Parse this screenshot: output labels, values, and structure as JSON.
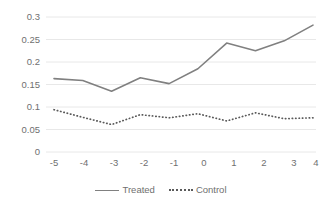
{
  "chart_data": {
    "type": "line",
    "title": "",
    "subtitle": "",
    "xlabel": "",
    "ylabel": "",
    "x": [
      -5,
      -4,
      -3,
      -2,
      -1,
      0,
      1,
      2,
      3,
      4
    ],
    "xtick_labels": [
      "-5",
      "-4",
      "-3",
      "-2",
      "-1",
      "0",
      "1",
      "2",
      "3",
      "4"
    ],
    "ytick_labels": [
      "0.3",
      "0.25",
      "0.2",
      "0.15",
      "0.1",
      "0.05",
      "0"
    ],
    "ytick_values": [
      0.3,
      0.25,
      0.2,
      0.15,
      0.1,
      0.05,
      0
    ],
    "ylim": [
      0,
      0.3
    ],
    "xlim": [
      -5,
      4
    ],
    "grid": "horizontal",
    "legend_position": "bottom-center",
    "series": [
      {
        "name": "Treated",
        "style": "solid",
        "color": "#808080",
        "values": [
          0.163,
          0.159,
          0.135,
          0.165,
          0.152,
          0.185,
          0.242,
          0.225,
          0.247,
          0.282
        ]
      },
      {
        "name": "Control",
        "style": "dotted",
        "color": "#5a5a5a",
        "values": [
          0.094,
          0.077,
          0.061,
          0.083,
          0.076,
          0.085,
          0.069,
          0.087,
          0.074,
          0.076
        ]
      }
    ],
    "colors": {
      "treated": "#808080",
      "control": "#5a5a5a",
      "gridline": "#e8e8e8",
      "tick_text": "#6f6f6f",
      "background": "#ffffff"
    }
  },
  "legend": {
    "entries": [
      {
        "label": "Treated"
      },
      {
        "label": "Control"
      }
    ]
  }
}
